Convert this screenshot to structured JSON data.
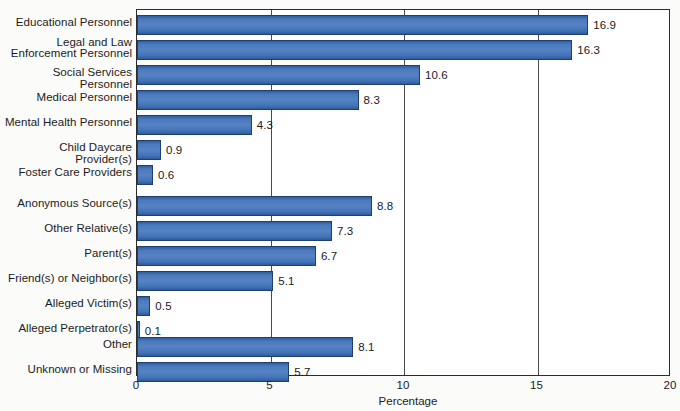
{
  "chart_data": {
    "type": "bar",
    "orientation": "horizontal",
    "title": "",
    "xlabel": "Percentage",
    "ylabel": "",
    "xlim": [
      0,
      20
    ],
    "xticks": [
      0,
      5,
      10,
      15,
      20
    ],
    "xtick_labels": [
      "0",
      "5",
      "10",
      "15",
      "20"
    ],
    "grid": true,
    "grid_axis": "x",
    "legend": false,
    "bar_color": "#4a79bd",
    "bar_edge_color": "#1f3f70",
    "categories": [
      "Educational Personnel",
      "Legal and Law\nEnforcement Personnel",
      "Social Services Personnel",
      "Medical Personnel",
      "Mental Health Personnel",
      "Child Daycare Provider(s)",
      "Foster Care Providers",
      "Anonymous Source(s)",
      "Other Relative(s)",
      "Parent(s)",
      "Friend(s) or Neighbor(s)",
      "Alleged Victim(s)",
      "Alleged Perpetrator(s)",
      "Other",
      "Unknown or Missing"
    ],
    "values": [
      16.9,
      16.3,
      10.6,
      8.3,
      4.3,
      0.9,
      0.6,
      8.8,
      7.3,
      6.7,
      5.1,
      0.5,
      0.1,
      8.1,
      5.7
    ],
    "value_labels": [
      "16.9",
      "16.3",
      "10.6",
      "8.3",
      "4.3",
      "0.9",
      "0.6",
      "8.8",
      "7.3",
      "6.7",
      "5.1",
      "0.5",
      "0.1",
      "8.1",
      "5.7"
    ]
  },
  "axis": {
    "x_title": "Percentage",
    "ticks": [
      "0",
      "5",
      "10",
      "15",
      "20"
    ]
  }
}
